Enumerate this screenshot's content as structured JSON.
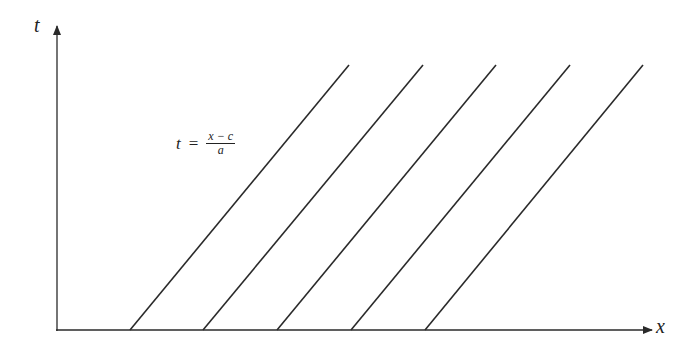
{
  "diagram": {
    "axes": {
      "vertical_label": "t",
      "horizontal_label": "x"
    },
    "equation": {
      "lhs": "t",
      "operator": "=",
      "numerator": "x − c",
      "denominator": "a"
    },
    "characteristic_lines": [
      {
        "x1": 130,
        "y1": 330,
        "x2": 349,
        "y2": 65
      },
      {
        "x1": 203,
        "y1": 330,
        "x2": 423,
        "y2": 65
      },
      {
        "x1": 277,
        "y1": 330,
        "x2": 496,
        "y2": 65
      },
      {
        "x1": 351,
        "y1": 330,
        "x2": 570,
        "y2": 65
      },
      {
        "x1": 425,
        "y1": 330,
        "x2": 643,
        "y2": 65
      }
    ],
    "colors": {
      "stroke": "#2a2a2a",
      "background": "#ffffff"
    }
  }
}
